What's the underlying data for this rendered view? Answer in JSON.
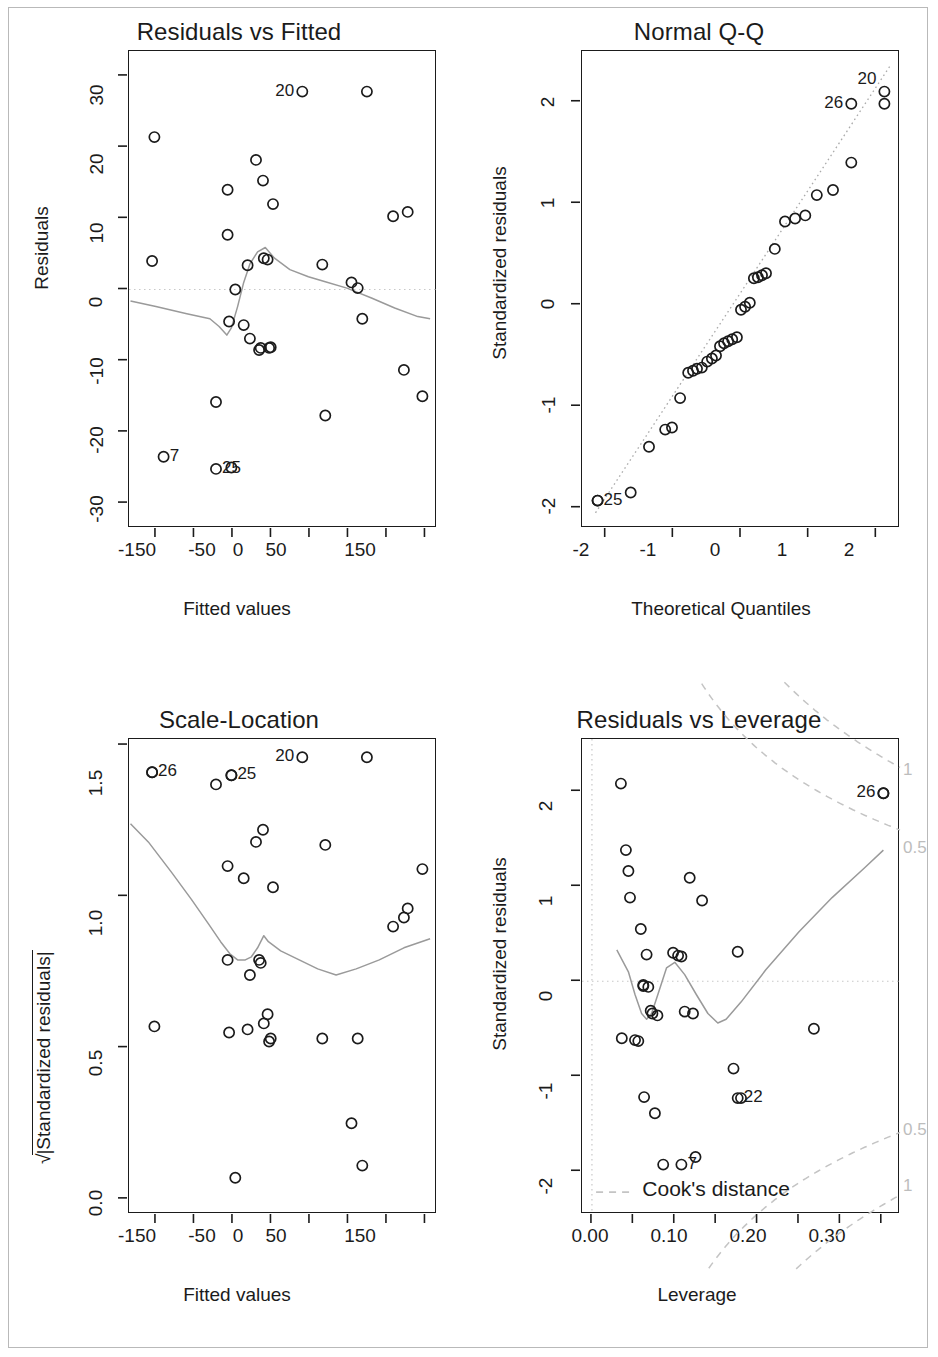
{
  "figure": {
    "kind": "regression-diagnostic-panel",
    "panel_count": 4,
    "frame_color": "#b9b9b9",
    "point_color": "#1b1b1b",
    "smoother_color": "#9a9a9a",
    "reference_color": "#c8c8c8"
  },
  "chart_data": [
    {
      "type": "scatter",
      "id": "residuals-vs-fitted",
      "title": "Residuals vs Fitted",
      "xlabel": "Fitted values",
      "ylabel": "Residuals",
      "xlim": [
        -185,
        215
      ],
      "ylim": [
        -33.5,
        33.5
      ],
      "xticks": [
        -150,
        -100,
        -50,
        0,
        50,
        100,
        150,
        200
      ],
      "xticklabels": [
        "-150",
        "",
        "-50",
        "0",
        "50",
        "",
        "150",
        ""
      ],
      "yticks": [
        -30,
        -20,
        -10,
        0,
        10,
        20,
        30
      ],
      "yticklabels": [
        "-30",
        "-20",
        "-10",
        "0",
        "10",
        "20",
        "30"
      ],
      "grid": false,
      "hline": 0,
      "x": [
        -152,
        -155,
        -72,
        -57,
        -57,
        -55,
        -52,
        -47,
        -36,
        -31,
        -28,
        -20,
        -16,
        -14,
        -11,
        -10,
        -5,
        -3,
        -1,
        2,
        66,
        70,
        104,
        112,
        118,
        124,
        158,
        172,
        177,
        196
      ],
      "y": [
        21.4,
        4.0,
        -15.8,
        14.0,
        7.7,
        -4.5,
        -25.0,
        0.0,
        -5.0,
        3.4,
        -6.9,
        18.2,
        -8.5,
        -8.2,
        15.3,
        4.4,
        4.2,
        -8.2,
        -8.1,
        12.0,
        3.5,
        -17.7,
        1.0,
        0.2,
        -4.1,
        27.8,
        10.3,
        -11.3,
        10.9,
        -15.0
      ],
      "labeled_points": [
        {
          "label": "20",
          "x": 40,
          "y": 27.8,
          "label_side": "left"
        },
        {
          "label": "7",
          "x": -140,
          "y": -23.5,
          "label_side": "right"
        },
        {
          "label": "25",
          "x": -72,
          "y": -25.2,
          "label_side": "right"
        }
      ],
      "smoother": [
        [
          -183,
          -1.6
        ],
        [
          -150,
          -2.4
        ],
        [
          -110,
          -3.4
        ],
        [
          -80,
          -4.1
        ],
        [
          -68,
          -5.2
        ],
        [
          -58,
          -6.4
        ],
        [
          -52,
          -5.4
        ],
        [
          -44,
          -2.4
        ],
        [
          -36,
          1.0
        ],
        [
          -28,
          3.6
        ],
        [
          -18,
          5.3
        ],
        [
          -8,
          5.9
        ],
        [
          4,
          4.4
        ],
        [
          24,
          2.8
        ],
        [
          48,
          1.8
        ],
        [
          70,
          1.1
        ],
        [
          98,
          0.2
        ],
        [
          130,
          -1.2
        ],
        [
          160,
          -2.6
        ],
        [
          190,
          -3.8
        ],
        [
          206,
          -4.1
        ]
      ]
    },
    {
      "type": "scatter",
      "id": "normal-qq",
      "title": "Normal Q-Q",
      "xlabel": "Theoretical Quantiles",
      "ylabel": "Standardized residuals",
      "xlim": [
        -2.35,
        2.35
      ],
      "ylim": [
        -2.2,
        2.5
      ],
      "xticks": [
        -2,
        -1,
        0,
        1,
        2
      ],
      "xticklabels": [
        "-2",
        "-1",
        "0",
        "1",
        "2"
      ],
      "yticks": [
        -2,
        -1,
        0,
        1,
        2
      ],
      "yticklabels": [
        "-2",
        "-1",
        "0",
        "1",
        "2"
      ],
      "grid": false,
      "qqline": [
        [
          -2.15,
          -2.05
        ],
        [
          2.2,
          2.35
        ]
      ],
      "x": [
        -2.12,
        -1.63,
        -1.36,
        -1.12,
        -1.02,
        -0.9,
        -0.78,
        -0.71,
        -0.65,
        -0.58,
        -0.5,
        -0.43,
        -0.37,
        -0.31,
        -0.25,
        -0.19,
        -0.13,
        -0.06,
        0.0,
        0.06,
        0.13,
        0.19,
        0.25,
        0.31,
        0.37,
        0.5,
        0.65,
        0.8,
        0.95,
        1.12,
        1.36,
        1.63,
        2.12
      ],
      "y": [
        -1.93,
        -1.85,
        -1.4,
        -1.23,
        -1.21,
        -0.92,
        -0.67,
        -0.65,
        -0.63,
        -0.62,
        -0.56,
        -0.53,
        -0.5,
        -0.41,
        -0.38,
        -0.36,
        -0.34,
        -0.32,
        -0.05,
        -0.02,
        0.02,
        0.26,
        0.27,
        0.29,
        0.31,
        0.55,
        0.82,
        0.85,
        0.88,
        1.08,
        1.13,
        1.4,
        1.98
      ],
      "labeled_points": [
        {
          "label": "25",
          "x": -2.12,
          "y": -1.93,
          "label_side": "right"
        },
        {
          "label": "26",
          "x": 1.63,
          "y": 1.98,
          "label_side": "left"
        },
        {
          "label": "20",
          "x": 2.12,
          "y": 2.1,
          "label_side": "left-up"
        }
      ]
    },
    {
      "type": "scatter",
      "id": "scale-location",
      "title": "Scale-Location",
      "xlabel": "Fitted values",
      "ylabel": "√|Standardized residuals|",
      "xlim": [
        -185,
        215
      ],
      "ylim": [
        -0.05,
        1.52
      ],
      "xticks": [
        -150,
        -100,
        -50,
        0,
        50,
        100,
        150,
        200
      ],
      "xticklabels": [
        "-150",
        "",
        "-50",
        "0",
        "50",
        "",
        "150",
        ""
      ],
      "yticks": [
        0.0,
        0.5,
        1.0,
        1.5
      ],
      "yticklabels": [
        "0.0",
        "0.5",
        "1.0",
        "1.5"
      ],
      "grid": false,
      "x": [
        -155,
        -152,
        -72,
        -57,
        -57,
        -55,
        -52,
        -47,
        -36,
        -31,
        -28,
        -20,
        -16,
        -14,
        -11,
        -10,
        -5,
        -3,
        -1,
        2,
        66,
        70,
        104,
        112,
        118,
        124,
        158,
        172,
        177,
        196
      ],
      "y": [
        1.41,
        0.57,
        1.37,
        1.1,
        0.79,
        0.55,
        1.4,
        0.07,
        1.06,
        0.56,
        0.74,
        1.18,
        0.79,
        0.78,
        1.22,
        0.58,
        0.61,
        0.52,
        0.53,
        1.03,
        0.53,
        1.17,
        0.25,
        0.53,
        0.11,
        1.46,
        0.9,
        0.93,
        0.96,
        1.09
      ],
      "labeled_points": [
        {
          "label": "26",
          "x": -155,
          "y": 1.41,
          "label_side": "right"
        },
        {
          "label": "25",
          "x": -52,
          "y": 1.4,
          "label_side": "right"
        },
        {
          "label": "20",
          "x": 40,
          "y": 1.46,
          "label_side": "left"
        }
      ],
      "smoother": [
        [
          -183,
          1.24
        ],
        [
          -160,
          1.18
        ],
        [
          -130,
          1.08
        ],
        [
          -104,
          0.99
        ],
        [
          -82,
          0.91
        ],
        [
          -66,
          0.85
        ],
        [
          -54,
          0.81
        ],
        [
          -44,
          0.79
        ],
        [
          -34,
          0.79
        ],
        [
          -26,
          0.8
        ],
        [
          -18,
          0.83
        ],
        [
          -10,
          0.87
        ],
        [
          -4,
          0.85
        ],
        [
          12,
          0.82
        ],
        [
          36,
          0.79
        ],
        [
          60,
          0.76
        ],
        [
          84,
          0.74
        ],
        [
          110,
          0.76
        ],
        [
          140,
          0.79
        ],
        [
          172,
          0.83
        ],
        [
          206,
          0.86
        ]
      ]
    },
    {
      "type": "scatter",
      "id": "residuals-vs-leverage",
      "title": "Residuals vs Leverage",
      "xlabel": "Leverage",
      "ylabel": "Standardized residuals",
      "xlim": [
        -0.012,
        0.372
      ],
      "ylim": [
        -2.45,
        2.55
      ],
      "xticks": [
        0.0,
        0.05,
        0.1,
        0.15,
        0.2,
        0.25,
        0.3,
        0.35
      ],
      "xticklabels": [
        "0.00",
        "",
        "0.10",
        "",
        "0.20",
        "",
        "0.30",
        ""
      ],
      "yticks": [
        -2,
        -1,
        0,
        1,
        2
      ],
      "yticklabels": [
        "-2",
        "-1",
        "0",
        "1",
        "2"
      ],
      "grid": false,
      "hline": 0,
      "vline": 0.0,
      "legend": "Cook's distance",
      "cook_levels": [
        "1",
        "0.5"
      ],
      "x": [
        0.035,
        0.041,
        0.044,
        0.036,
        0.046,
        0.052,
        0.056,
        0.059,
        0.062,
        0.062,
        0.063,
        0.066,
        0.068,
        0.071,
        0.073,
        0.076,
        0.079,
        0.086,
        0.098,
        0.104,
        0.108,
        0.112,
        0.118,
        0.122,
        0.125,
        0.133,
        0.171,
        0.176,
        0.18,
        0.268,
        0.352
      ],
      "y": [
        2.08,
        1.38,
        1.16,
        -0.6,
        0.88,
        -0.62,
        -0.63,
        0.55,
        -0.04,
        -0.05,
        -1.22,
        0.28,
        -0.06,
        -0.31,
        -0.34,
        -1.39,
        -0.36,
        -1.93,
        0.3,
        0.27,
        0.26,
        -0.32,
        1.09,
        -0.34,
        -1.85,
        0.85,
        -0.92,
        0.31,
        -1.23,
        -0.5,
        1.98
      ],
      "labeled_points": [
        {
          "label": "26",
          "x": 0.352,
          "y": 1.98,
          "label_side": "left"
        },
        {
          "label": "22",
          "x": 0.176,
          "y": -1.23,
          "label_side": "right"
        },
        {
          "label": "7",
          "x": 0.108,
          "y": -1.93,
          "label_side": "right"
        }
      ],
      "smoother": [
        [
          0.03,
          0.33
        ],
        [
          0.044,
          0.1
        ],
        [
          0.052,
          -0.14
        ],
        [
          0.06,
          -0.34
        ],
        [
          0.066,
          -0.4
        ],
        [
          0.072,
          -0.34
        ],
        [
          0.08,
          -0.13
        ],
        [
          0.09,
          0.14
        ],
        [
          0.1,
          0.2
        ],
        [
          0.112,
          0.07
        ],
        [
          0.126,
          -0.14
        ],
        [
          0.14,
          -0.34
        ],
        [
          0.152,
          -0.44
        ],
        [
          0.162,
          -0.4
        ],
        [
          0.18,
          -0.22
        ],
        [
          0.21,
          0.12
        ],
        [
          0.25,
          0.52
        ],
        [
          0.29,
          0.88
        ],
        [
          0.33,
          1.2
        ],
        [
          0.352,
          1.38
        ]
      ]
    }
  ]
}
